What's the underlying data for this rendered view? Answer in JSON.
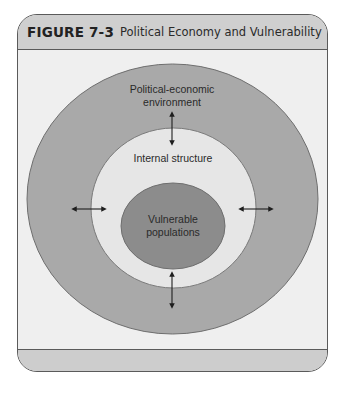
{
  "figure": {
    "label": "FIGURE 7-3",
    "title": "Political Economy and Vulnerability"
  },
  "diagram": {
    "type": "concentric-circles",
    "layers": [
      {
        "name": "outer",
        "lines": [
          "Political-economic",
          "environment"
        ],
        "color": "#a9a9a9"
      },
      {
        "name": "middle",
        "lines": [
          "Internal structure"
        ],
        "color": "#e6e6e6"
      },
      {
        "name": "inner",
        "lines": [
          "Vulnerable",
          "populations"
        ],
        "color": "#8c8c8c"
      }
    ],
    "arrows": [
      {
        "position": "top",
        "direction": "bidirectional-vertical"
      },
      {
        "position": "left",
        "direction": "bidirectional-horizontal"
      },
      {
        "position": "right",
        "direction": "bidirectional-horizontal"
      },
      {
        "position": "bottom",
        "direction": "bidirectional-vertical"
      }
    ],
    "colors": {
      "frame_bg": "#efefef",
      "header_bg": "#cfcfcf",
      "border": "#5a5a5a",
      "arrow": "#1e1e1e"
    }
  }
}
